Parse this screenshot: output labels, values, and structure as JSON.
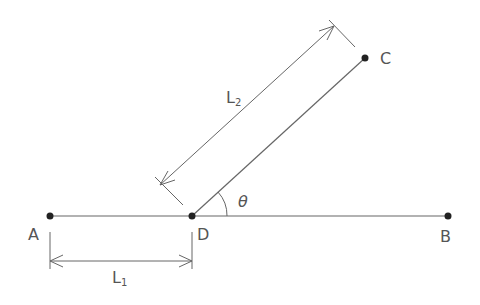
{
  "diagram": {
    "points": {
      "A": {
        "label": "A",
        "x": 50,
        "y": 216
      },
      "D": {
        "label": "D",
        "x": 192,
        "y": 216
      },
      "B": {
        "label": "B",
        "x": 448,
        "y": 216
      },
      "C": {
        "label": "C",
        "x": 365,
        "y": 58
      }
    },
    "dimensions": {
      "L1": {
        "label": "L",
        "sub": "1"
      },
      "L2": {
        "label": "L",
        "sub": "2"
      }
    },
    "angle": {
      "label": "θ"
    },
    "colors": {
      "line": "#555555",
      "point": "#222222",
      "text": "#555555"
    }
  }
}
